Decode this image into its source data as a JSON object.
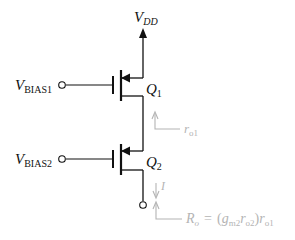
{
  "diagram": {
    "type": "cascode PMOS current source schematic",
    "supply": {
      "label": "V",
      "subscript": "DD"
    },
    "inputs": [
      {
        "label": "V",
        "subscript": "BIAS1"
      },
      {
        "label": "V",
        "subscript": "BIAS2"
      }
    ],
    "transistors": [
      {
        "label": "Q",
        "subscript": "1"
      },
      {
        "label": "Q",
        "subscript": "2"
      }
    ],
    "annotations": {
      "ro1": {
        "label": "r",
        "subscript": "o1"
      },
      "current": {
        "label": "I"
      },
      "output_resistance": {
        "label": "R",
        "subscript": "o",
        "equals": "=",
        "expr_open": "(",
        "gm": "g",
        "gm_sub": "m2",
        "ro2": "r",
        "ro2_sub": "o2",
        "expr_close": ")",
        "ro1": "r",
        "ro1_sub": "o1"
      }
    },
    "colors": {
      "wire": "#111111",
      "annotation": "#b4b4b4"
    }
  }
}
